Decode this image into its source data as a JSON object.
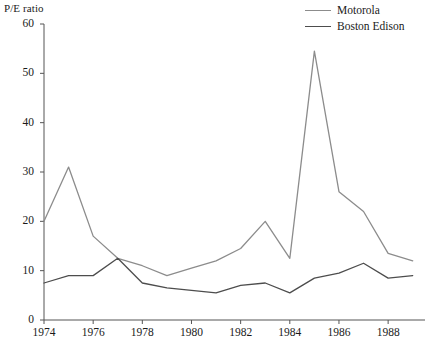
{
  "chart_data": {
    "type": "line",
    "title": "",
    "ylabel": "P/E ratio",
    "xlabel": "",
    "x": [
      1974,
      1975,
      1976,
      1977,
      1978,
      1979,
      1980,
      1981,
      1982,
      1983,
      1984,
      1985,
      1986,
      1987,
      1988,
      1989
    ],
    "xlim": [
      1974,
      1989.5
    ],
    "ylim": [
      0,
      60
    ],
    "y_ticks": [
      0,
      10,
      20,
      30,
      40,
      50,
      60
    ],
    "x_ticks": [
      1974,
      1976,
      1978,
      1980,
      1982,
      1984,
      1986,
      1988
    ],
    "x_tick_labels": [
      "1974",
      "1976",
      "1978",
      "1980",
      "1982",
      "1984",
      "1986",
      "1988"
    ],
    "y_tick_labels": [
      "0",
      "10",
      "20",
      "30",
      "40",
      "50",
      "60"
    ],
    "grid": false,
    "legend_position": "top-right",
    "series": [
      {
        "name": "Motorola",
        "color": "#8c8c8c",
        "values": [
          20,
          31,
          17,
          12.5,
          11,
          9,
          10.5,
          12,
          14.5,
          20,
          12.5,
          54.5,
          26,
          22,
          13.5,
          12
        ]
      },
      {
        "name": "Boston Edison",
        "color": "#4d4d4d",
        "values": [
          7.5,
          9,
          9,
          12.5,
          7.5,
          6.5,
          6,
          5.5,
          7,
          7.5,
          5.5,
          8.5,
          9.5,
          11.5,
          8.5,
          9
        ]
      }
    ]
  },
  "axis": {
    "y_title": "P/E ratio"
  },
  "legend": {
    "items": [
      {
        "label": "Motorola"
      },
      {
        "label": "Boston Edison"
      }
    ]
  },
  "colors": {
    "motorola": "#8c8c8c",
    "boston_edison": "#4d4d4d",
    "axis": "#555555",
    "text": "#1a1a1a",
    "background": "#ffffff"
  }
}
